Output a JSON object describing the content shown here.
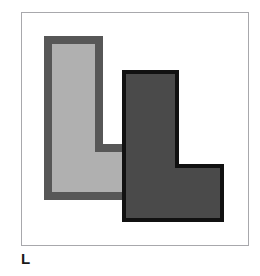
{
  "figure": {
    "label": "L",
    "background_color": "#ffffff",
    "frame": {
      "name": "figure-frame",
      "x": 21,
      "y": 12,
      "width": 228,
      "height": 234,
      "border_color": "#a8a8ac",
      "border_width": 1,
      "fill": "#ffffff"
    },
    "shapes": [
      {
        "name": "light-l-polyomino",
        "description": "L-shaped polygon, light gray fill with dark gray outline, drawn behind the dark shape",
        "fill_color": "#b0b0b0",
        "stroke_color": "#575757",
        "stroke_width": 8,
        "points": "48,40 99,40 99,148 139,148 139,196 48,196",
        "z_order": 1
      },
      {
        "name": "dark-l-polyomino",
        "description": "L-shaped polygon, dark gray fill with black outline, drawn on top of the light shape",
        "fill_color": "#4a4a4a",
        "stroke_color": "#111111",
        "stroke_width": 4,
        "points": "124,72 177,72 177,166 222,166 222,220 124,220",
        "z_order": 2
      }
    ]
  }
}
